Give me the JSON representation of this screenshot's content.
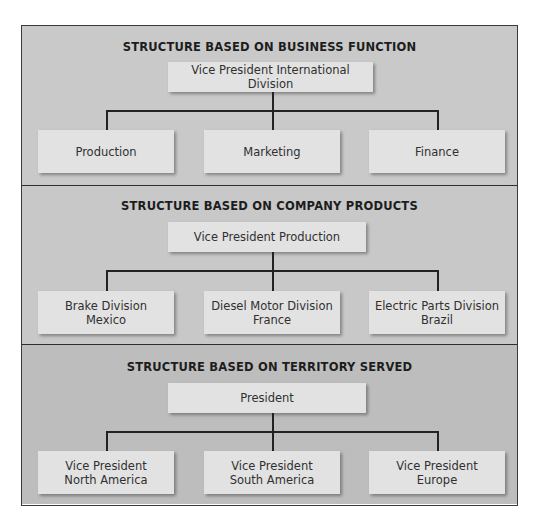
{
  "sections": [
    {
      "title": "STRUCTURE BASED ON BUSINESS FUNCTION",
      "top": {
        "line1": "Vice President International Division"
      },
      "children": [
        {
          "line1": "Production",
          "line2": ""
        },
        {
          "line1": "Marketing",
          "line2": ""
        },
        {
          "line1": "Finance",
          "line2": ""
        }
      ]
    },
    {
      "title": "STRUCTURE BASED ON COMPANY PRODUCTS",
      "top": {
        "line1": "Vice President Production"
      },
      "children": [
        {
          "line1": "Brake Division",
          "line2": "Mexico"
        },
        {
          "line1": "Diesel Motor Division",
          "line2": "France"
        },
        {
          "line1": "Electric Parts Division",
          "line2": "Brazil"
        }
      ]
    },
    {
      "title": "STRUCTURE BASED ON TERRITORY SERVED",
      "top": {
        "line1": "President"
      },
      "children": [
        {
          "line1": "Vice President",
          "line2": "North America"
        },
        {
          "line1": "Vice President",
          "line2": "South America"
        },
        {
          "line1": "Vice President",
          "line2": "Europe"
        }
      ]
    }
  ],
  "colors": {
    "section_bg_1": "#c9c9c9",
    "section_bg_2": "#c8c8c8",
    "section_bg_3": "#bdbdbd",
    "box_fill": "#e2e2e2",
    "border": "#2e2e2e"
  }
}
